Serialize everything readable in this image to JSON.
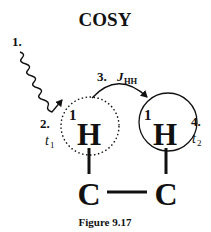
{
  "title": "COSY",
  "caption": "Figure 9.17",
  "steps": {
    "step1": {
      "number": "1."
    },
    "step2": {
      "number": "2.",
      "time": "t",
      "time_sub": "1"
    },
    "step3": {
      "number": "3.",
      "coupling": "J",
      "coupling_sub": "HH"
    },
    "step4": {
      "number": "4.",
      "time": "t",
      "time_sub": "2"
    }
  },
  "nuclei": [
    {
      "mass": "1",
      "symbol": "H",
      "circle": "dotted"
    },
    {
      "mass": "1",
      "symbol": "H",
      "circle": "solid"
    }
  ],
  "carbons": [
    {
      "symbol": "C"
    },
    {
      "symbol": "C"
    }
  ]
}
